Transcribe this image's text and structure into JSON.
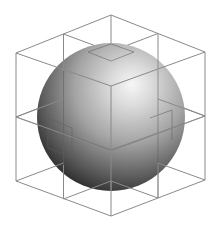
{
  "figure": {
    "title": "Sphere inscribed in 2x2x2 cube lattice",
    "colors": {
      "background": "#ffffff",
      "wireframe": "#8a8a8a",
      "sphere_highlight": "#f4f4f4",
      "sphere_mid": "#a8a8a8",
      "sphere_shadow": "#2e2e2e"
    },
    "cube": {
      "subdivisions": 2,
      "vertices": {
        "top_back": [
          111,
          15
        ],
        "top_left": [
          16,
          53
        ],
        "top_right": [
          205,
          52
        ],
        "top_front": [
          111,
          86
        ],
        "bottom_left": [
          16,
          181
        ],
        "bottom_right": [
          205,
          180
        ],
        "bottom_front": [
          111,
          216
        ]
      }
    },
    "sphere": {
      "center": [
        111,
        117
      ],
      "radius": 74
    }
  }
}
